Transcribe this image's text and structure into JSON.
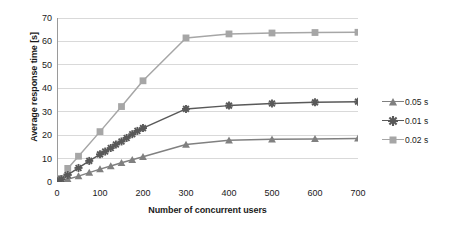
{
  "chart_data": {
    "type": "line",
    "title": "",
    "xlabel": "Number of concurrent users",
    "ylabel": "Average response time [s]",
    "xlim": [
      0,
      700
    ],
    "ylim": [
      0,
      70
    ],
    "xticks": [
      0,
      100,
      200,
      300,
      400,
      500,
      600,
      700
    ],
    "yticks": [
      0,
      10,
      20,
      30,
      40,
      50,
      60,
      70
    ],
    "grid": "horizontal",
    "legend_position": "right",
    "series": [
      {
        "name": "0.05 s",
        "color": "#808080",
        "marker": "triangle",
        "x": [
          0,
          10,
          25,
          50,
          75,
          100,
          125,
          150,
          175,
          200,
          300,
          400,
          500,
          600,
          700
        ],
        "y": [
          0.2,
          0.6,
          1.2,
          2.5,
          4.0,
          5.5,
          6.8,
          8.2,
          9.5,
          10.8,
          16.0,
          17.8,
          18.2,
          18.4,
          18.6
        ]
      },
      {
        "name": "0.01 s",
        "color": "#595959",
        "marker": "star",
        "x": [
          0,
          10,
          25,
          50,
          75,
          100,
          112,
          125,
          137,
          150,
          162,
          175,
          187,
          200,
          300,
          400,
          500,
          600,
          700
        ],
        "y": [
          0.3,
          1.2,
          3.0,
          6.0,
          9.0,
          11.8,
          13.0,
          14.5,
          16.0,
          17.3,
          18.8,
          20.4,
          21.8,
          23.0,
          31.2,
          32.6,
          33.5,
          34.0,
          34.3
        ]
      },
      {
        "name": "0.02 s",
        "color": "#a6a6a6",
        "marker": "square",
        "x": [
          0,
          10,
          25,
          50,
          100,
          150,
          200,
          300,
          400,
          500,
          600,
          700
        ],
        "y": [
          0.3,
          1.5,
          5.8,
          11.0,
          21.5,
          32.2,
          43.2,
          61.5,
          63.2,
          63.6,
          63.8,
          63.9
        ]
      }
    ]
  },
  "axis": {
    "y_tick_labels": [
      "0",
      "10",
      "20",
      "30",
      "40",
      "50",
      "60",
      "70"
    ],
    "x_tick_labels": [
      "0",
      "100",
      "200",
      "300",
      "400",
      "500",
      "600",
      "700"
    ]
  },
  "legend": {
    "items": [
      {
        "label": "0.05 s"
      },
      {
        "label": "0.01 s"
      },
      {
        "label": "0.02 s"
      }
    ]
  }
}
